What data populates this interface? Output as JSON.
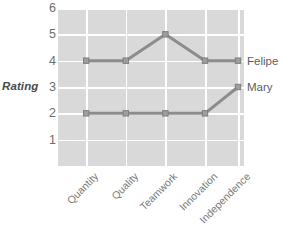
{
  "chart_data": {
    "type": "line",
    "title": "",
    "xlabel": "",
    "ylabel": "Rating",
    "categories": [
      "Quantity",
      "Quality",
      "Teamwork",
      "Innovation",
      "Independence"
    ],
    "series": [
      {
        "name": "Felipe",
        "values": [
          4,
          4,
          5,
          4,
          4
        ],
        "color": "#8c8c8c"
      },
      {
        "name": "Mary",
        "values": [
          2,
          2,
          2,
          2,
          3
        ],
        "color": "#8c8c8c"
      }
    ],
    "yticks": [
      6,
      5,
      4,
      3,
      2,
      1
    ],
    "ylim": [
      0,
      6
    ],
    "grid": true,
    "legend_position": "right-inline",
    "marker": "square",
    "plot_background": "#d9d9d9",
    "gridline_color": "#ffffff"
  }
}
